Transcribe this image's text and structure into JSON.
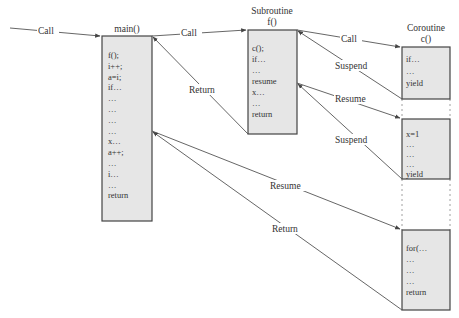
{
  "diagram": {
    "blocks": {
      "main": {
        "title": "main()",
        "lines": [
          "f();",
          "i++;",
          "a=i;",
          "if…",
          "…",
          "…",
          "…",
          "…",
          "x…",
          "a++;",
          "…",
          "i…",
          "…",
          "return"
        ]
      },
      "subroutine": {
        "title_line1": "Subroutine",
        "title_line2": "f()",
        "lines": [
          "c();",
          "if…",
          "…",
          "resume",
          "x…",
          "…",
          "return"
        ]
      },
      "coroutine": {
        "title_line1": "Coroutine",
        "title_line2": "c()",
        "segment1": [
          "if…",
          "…",
          "yield"
        ],
        "segment2": [
          "x=1",
          "…",
          "…",
          "…",
          "yield"
        ],
        "segment3": [
          "for(…",
          "…",
          "…",
          "…",
          "return"
        ]
      }
    },
    "edges": [
      {
        "id": "call-in",
        "label": "Call",
        "from": "external",
        "to": "main"
      },
      {
        "id": "call-main-f",
        "label": "Call",
        "from": "main",
        "to": "subroutine"
      },
      {
        "id": "return-f-main",
        "label": "Return",
        "from": "subroutine",
        "to": "main"
      },
      {
        "id": "call-f-c",
        "label": "Call",
        "from": "subroutine",
        "to": "coroutine"
      },
      {
        "id": "suspend-1",
        "label": "Suspend",
        "from": "coroutine",
        "to": "subroutine"
      },
      {
        "id": "resume-f-c",
        "label": "Resume",
        "from": "subroutine",
        "to": "coroutine"
      },
      {
        "id": "suspend-2",
        "label": "Suspend",
        "from": "coroutine",
        "to": "subroutine"
      },
      {
        "id": "resume-main-c",
        "label": "Resume",
        "from": "main",
        "to": "coroutine"
      },
      {
        "id": "return-c-main",
        "label": "Return",
        "from": "coroutine",
        "to": "main"
      }
    ]
  }
}
